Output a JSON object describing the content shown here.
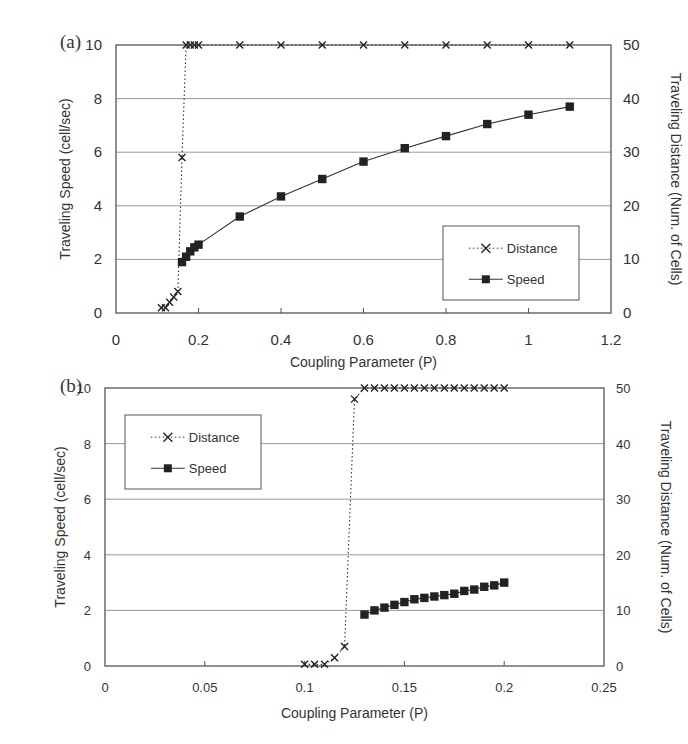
{
  "figure": {
    "panel_a_label": "(a)",
    "panel_b_label": "(b)",
    "colors": {
      "line": "#333333",
      "grid": "#999999",
      "frame": "#555555",
      "marker": "#222222"
    }
  },
  "chart_data": [
    {
      "type": "line",
      "panel": "(a)",
      "title": "",
      "xlabel": "Coupling Parameter (P)",
      "ylabel": "Traveling Speed (cell/sec)",
      "y2label": "Traveling Distance (Num. of Cells)",
      "xlim": [
        0,
        1.2
      ],
      "ylim": [
        0,
        10
      ],
      "y2lim": [
        0,
        50
      ],
      "xticks": [
        "0",
        "0.2",
        "0.4",
        "0.6",
        "0.8",
        "1",
        "1.2"
      ],
      "yticks": [
        "0",
        "2",
        "4",
        "6",
        "8",
        "10"
      ],
      "y2ticks": [
        "0",
        "10",
        "20",
        "30",
        "40",
        "50"
      ],
      "grid": "horizontal",
      "legend": {
        "position": "inside lower right",
        "entries": [
          "Distance",
          "Speed"
        ]
      },
      "series": [
        {
          "name": "Distance",
          "axis": "right",
          "style": "dotted, x markers",
          "x": [
            0.11,
            0.12,
            0.13,
            0.14,
            0.15,
            0.16,
            0.17,
            0.18,
            0.19,
            0.2,
            0.3,
            0.4,
            0.5,
            0.6,
            0.7,
            0.8,
            0.9,
            1.0,
            1.1
          ],
          "y": [
            1,
            1,
            2,
            3,
            4,
            29,
            50,
            50,
            50,
            50,
            50,
            50,
            50,
            50,
            50,
            50,
            50,
            50,
            50
          ]
        },
        {
          "name": "Speed",
          "axis": "left",
          "style": "solid, filled square markers",
          "x": [
            0.16,
            0.17,
            0.18,
            0.19,
            0.2,
            0.3,
            0.4,
            0.5,
            0.6,
            0.7,
            0.8,
            0.9,
            1.0,
            1.1
          ],
          "y": [
            1.9,
            2.1,
            2.3,
            2.45,
            2.55,
            3.6,
            4.35,
            5.0,
            5.65,
            6.15,
            6.6,
            7.05,
            7.4,
            7.7
          ]
        }
      ]
    },
    {
      "type": "line",
      "panel": "(b)",
      "title": "",
      "xlabel": "Coupling Parameter (P)",
      "ylabel": "Traveling Speed (cell/sec)",
      "y2label": "Traveling Distance (Num. of Cells)",
      "xlim": [
        0,
        0.25
      ],
      "ylim": [
        0,
        10
      ],
      "y2lim": [
        0,
        50
      ],
      "xticks": [
        "0",
        "0.05",
        "0.1",
        "0.15",
        "0.2",
        "0.25"
      ],
      "yticks": [
        "0",
        "2",
        "4",
        "6",
        "8",
        "10"
      ],
      "y2ticks": [
        "0",
        "10",
        "20",
        "30",
        "40",
        "50"
      ],
      "grid": "horizontal",
      "legend": {
        "position": "inside upper left",
        "entries": [
          "Distance",
          "Speed"
        ]
      },
      "series": [
        {
          "name": "Distance",
          "axis": "right",
          "style": "dotted, x markers",
          "x": [
            0.1,
            0.105,
            0.11,
            0.115,
            0.12,
            0.125,
            0.13,
            0.135,
            0.14,
            0.145,
            0.15,
            0.155,
            0.16,
            0.165,
            0.17,
            0.175,
            0.18,
            0.185,
            0.19,
            0.195,
            0.2
          ],
          "y": [
            0.3,
            0.3,
            0.3,
            1.5,
            3.5,
            48,
            50,
            50,
            50,
            50,
            50,
            50,
            50,
            50,
            50,
            50,
            50,
            50,
            50,
            50,
            50
          ]
        },
        {
          "name": "Speed",
          "axis": "left",
          "style": "solid, filled square markers",
          "x": [
            0.13,
            0.135,
            0.14,
            0.145,
            0.15,
            0.155,
            0.16,
            0.165,
            0.17,
            0.175,
            0.18,
            0.185,
            0.19,
            0.195,
            0.2
          ],
          "y": [
            1.85,
            2.0,
            2.1,
            2.2,
            2.3,
            2.4,
            2.45,
            2.5,
            2.55,
            2.6,
            2.7,
            2.75,
            2.85,
            2.9,
            3.0
          ]
        }
      ]
    }
  ]
}
